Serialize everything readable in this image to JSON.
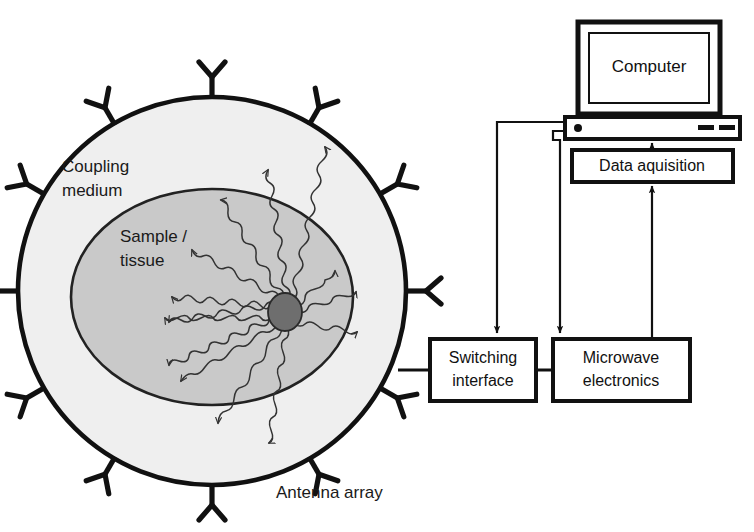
{
  "figure": {
    "type": "system-block-diagram",
    "title_visible": false,
    "background_color": "#ffffff"
  },
  "labels": {
    "coupling_medium_line1": "Coupling",
    "coupling_medium_line2": "medium",
    "sample_tissue_line1": "Sample /",
    "sample_tissue_line2": "tissue",
    "antenna_array": "Antenna array"
  },
  "blocks": {
    "computer": {
      "label": "Computer",
      "shape": "monitor-with-base"
    },
    "data_acquisition": {
      "label": "Data aquisition",
      "shape": "rect"
    },
    "switching_interface": {
      "label_line1": "Switching",
      "label_line2": "interface",
      "shape": "rect"
    },
    "microwave_electronics": {
      "label_line1": "Microwave",
      "label_line2": "electronics",
      "shape": "rect"
    }
  },
  "imaging_chamber": {
    "outer_ring_name": "coupling-medium-circle",
    "outer_fill": "#efefef",
    "outer_stroke": "#111111",
    "inner_region_name": "sample-tissue-ellipse",
    "inner_fill": "#c9c9c9",
    "inner_stroke": "#222222",
    "target_name": "tumor-inclusion",
    "target_fill": "#6e6e6e",
    "antenna_count": 12,
    "antenna_glyph": "Y-shaped dipole"
  },
  "connections": [
    {
      "name": "chamber-to-switching",
      "from": "antenna-array",
      "to": "switching-interface",
      "arrow": false
    },
    {
      "name": "switching-to-microwave",
      "from": "switching-interface",
      "to": "microwave-electronics",
      "arrow": false
    },
    {
      "name": "computer-to-switching",
      "from": "computer-base",
      "to": "switching-interface",
      "arrow": true
    },
    {
      "name": "computer-to-microwave",
      "from": "computer-base",
      "to": "microwave-electronics",
      "arrow": true
    },
    {
      "name": "microwave-to-data-acquisition",
      "from": "microwave-electronics",
      "to": "data-acquisition",
      "arrow": true
    },
    {
      "name": "data-acquisition-to-computer",
      "from": "data-acquisition",
      "to": "computer-base",
      "arrow": true
    }
  ]
}
